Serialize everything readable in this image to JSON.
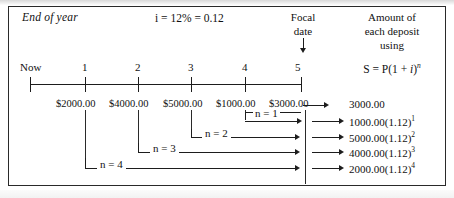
{
  "diagram": {
    "title_left": "End of year",
    "rate_label": "i = 12% = 0.12",
    "focal": {
      "line1": "Focal",
      "line2": "date",
      "arrow_icon": "down-arrow-icon"
    },
    "right_header": {
      "line1": "Amount of",
      "line2": "each deposit",
      "line3": "using"
    },
    "formula": {
      "prefix": "S = P(1 + ",
      "var": "i",
      "exp": "n"
    },
    "timeline": {
      "origin_label": "Now",
      "ticks": [
        "1",
        "2",
        "3",
        "4",
        "5"
      ]
    },
    "deposits": [
      {
        "year": "1",
        "amount": "$2000.00"
      },
      {
        "year": "2",
        "amount": "$4000.00"
      },
      {
        "year": "3",
        "amount": "$5000.00"
      },
      {
        "year": "4",
        "amount": "$1000.00"
      },
      {
        "year": "5",
        "amount": "$3000.00"
      }
    ],
    "brackets": [
      {
        "label": "n = 1"
      },
      {
        "label": "n = 2"
      },
      {
        "label": "n = 3"
      },
      {
        "label": "n = 4"
      }
    ],
    "results": [
      {
        "base": "3000.00",
        "factor": "",
        "exp": ""
      },
      {
        "base": "1000.00",
        "factor": "(1.12)",
        "exp": "1"
      },
      {
        "base": "5000.00",
        "factor": "(1.12)",
        "exp": "2"
      },
      {
        "base": "4000.00",
        "factor": "(1.12)",
        "exp": "3"
      },
      {
        "base": "2000.00",
        "factor": "(1.12)",
        "exp": "4"
      }
    ],
    "colors": {
      "ink": "#1d1d1d",
      "border": "#2a2a2a",
      "paper": "#ffffff"
    }
  }
}
